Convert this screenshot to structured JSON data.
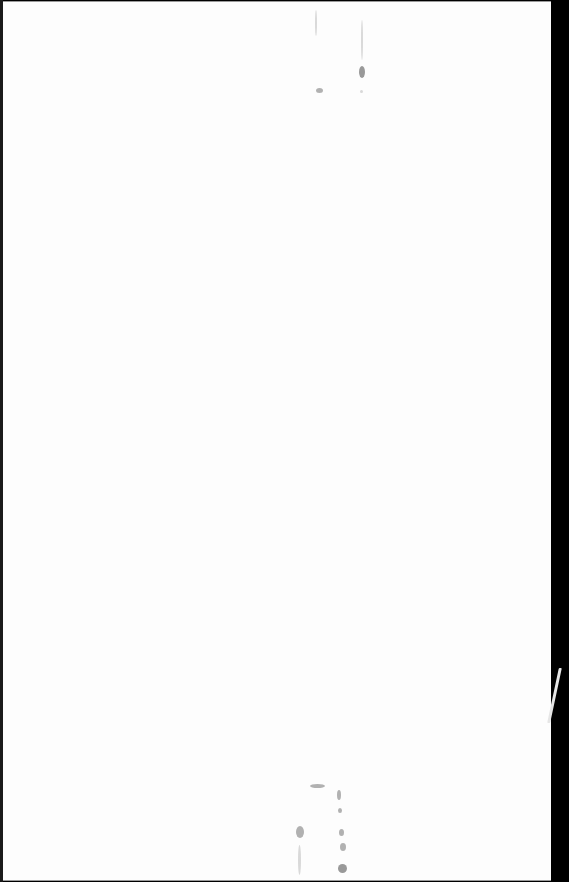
{
  "document": {
    "type": "scanned-page",
    "content": "",
    "page_color": "#fdfdfd",
    "border_color": "#000000"
  },
  "artifacts": {
    "top_marks": [
      {
        "x": 315,
        "y": 10,
        "w": 2,
        "h": 26,
        "tone": "faint"
      },
      {
        "x": 316,
        "y": 88,
        "w": 7,
        "h": 5,
        "tone": "normal"
      },
      {
        "x": 361,
        "y": 20,
        "w": 2,
        "h": 40,
        "tone": "faint"
      },
      {
        "x": 359,
        "y": 66,
        "w": 6,
        "h": 12,
        "tone": "dark"
      },
      {
        "x": 360,
        "y": 90,
        "w": 3,
        "h": 3,
        "tone": "faint"
      }
    ],
    "bottom_marks": [
      {
        "x": 310,
        "y": 784,
        "w": 15,
        "h": 4,
        "tone": "normal"
      },
      {
        "x": 337,
        "y": 790,
        "w": 4,
        "h": 10,
        "tone": "normal"
      },
      {
        "x": 338,
        "y": 808,
        "w": 4,
        "h": 5,
        "tone": "normal"
      },
      {
        "x": 296,
        "y": 826,
        "w": 8,
        "h": 12,
        "tone": "normal"
      },
      {
        "x": 298,
        "y": 845,
        "w": 3,
        "h": 30,
        "tone": "faint"
      },
      {
        "x": 339,
        "y": 829,
        "w": 5,
        "h": 7,
        "tone": "normal"
      },
      {
        "x": 340,
        "y": 843,
        "w": 6,
        "h": 8,
        "tone": "normal"
      },
      {
        "x": 338,
        "y": 864,
        "w": 9,
        "h": 9,
        "tone": "dark"
      }
    ],
    "edge_scratch": {
      "x": 553,
      "y": 668,
      "w": 3,
      "h": 55
    }
  }
}
